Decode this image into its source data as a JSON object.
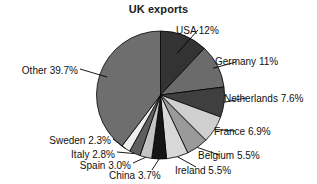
{
  "chart_data": {
    "type": "pie",
    "title": "UK exports",
    "xlabel": "",
    "ylabel": "",
    "units": "percent",
    "legend_position": "callout-labels",
    "grid": false,
    "start_angle_deg": 0,
    "direction": "clockwise",
    "categories": [
      "USA",
      "Germany",
      "Netherlands",
      "France",
      "Belgium",
      "Ireland",
      "China",
      "Spain",
      "Italy",
      "Sweden",
      "Other"
    ],
    "values": [
      12,
      11,
      7.6,
      6.9,
      5.5,
      5.5,
      3.7,
      3.0,
      2.8,
      2.3,
      39.7
    ],
    "slices": [
      {
        "name": "USA",
        "value": 12,
        "label": "USA 12%",
        "color": "#333333",
        "side": "right"
      },
      {
        "name": "Germany",
        "value": 11,
        "label": "Germany 11%",
        "color": "#6b6b6b",
        "side": "right"
      },
      {
        "name": "Netherlands",
        "value": 7.6,
        "label": "Netherlands 7.6%",
        "color": "#3f3f3f",
        "side": "right"
      },
      {
        "name": "France",
        "value": 6.9,
        "label": "France 6.9%",
        "color": "#cfcfcf",
        "side": "right"
      },
      {
        "name": "Belgium",
        "value": 5.5,
        "label": "Belgium 5.5%",
        "color": "#9a9a9a",
        "side": "right"
      },
      {
        "name": "Ireland",
        "value": 5.5,
        "label": "Ireland 5.5%",
        "color": "#d8d8d8",
        "side": "right"
      },
      {
        "name": "China",
        "value": 3.7,
        "label": "China 3.7%",
        "color": "#151515",
        "side": "bottom"
      },
      {
        "name": "Spain",
        "value": 3.0,
        "label": "Spain 3.0%",
        "color": "#c4c4c4",
        "side": "left"
      },
      {
        "name": "Italy",
        "value": 2.8,
        "label": "Italy 2.8%",
        "color": "#5e5e5e",
        "side": "left"
      },
      {
        "name": "Sweden",
        "value": 2.3,
        "label": "Sweden 2.3%",
        "color": "#efefef",
        "side": "left"
      },
      {
        "name": "Other",
        "value": 39.7,
        "label": "Other 39.7%",
        "color": "#6e6e6e",
        "side": "left"
      }
    ]
  },
  "style": {
    "slice_stroke": "#000000",
    "leader_line_color": "#000000",
    "background": "#ffffff",
    "text_color": "#111111"
  },
  "labels": {
    "usa": "USA 12%",
    "germany": "Germany 11%",
    "netherlands": "Netherlands 7.6%",
    "france": "France 6.9%",
    "belgium": "Belgium 5.5%",
    "ireland": "Ireland 5.5%",
    "china": "China 3.7%",
    "spain": "Spain 3.0%",
    "italy": "Italy 2.8%",
    "sweden": "Sweden 2.3%",
    "other": "Other 39.7%"
  }
}
